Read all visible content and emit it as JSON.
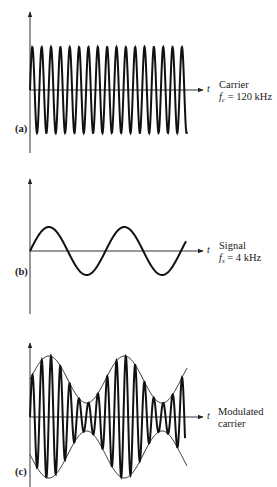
{
  "figure": {
    "panels": [
      {
        "id": "a",
        "label": "(a)",
        "axis_label": "t",
        "caption_line1": "Carrier",
        "caption_var": "f",
        "caption_sub": "c",
        "caption_rest": " = 120 kHz",
        "waveform": "carrier",
        "frequency_khz": 120,
        "axis_x": 30,
        "axis_y": 90,
        "axis_top": 12,
        "axis_bottom": 153,
        "axis_right": 203,
        "wave_start": 30,
        "wave_end": 187,
        "amplitude": 43,
        "period_px": 9.35
      },
      {
        "id": "b",
        "label": "(b)",
        "axis_label": "t",
        "caption_line1": "Signal",
        "caption_var": "f",
        "caption_sub": "s",
        "caption_rest": " = 4 kHz",
        "waveform": "signal",
        "frequency_khz": 4,
        "axis_x": 30,
        "axis_y": 251,
        "axis_top": 179,
        "axis_bottom": 314,
        "axis_right": 203,
        "wave_start": 30,
        "wave_end": 186,
        "amplitude": 24,
        "period_px": 75.5
      },
      {
        "id": "c",
        "label": "(c)",
        "axis_label": "t",
        "caption_line1": "Modulated",
        "caption_line2": "carrier",
        "waveform": "modulated",
        "axis_x": 30,
        "axis_y": 417,
        "axis_top": 343,
        "axis_bottom": 487,
        "axis_right": 203,
        "wave_start": 30,
        "wave_end": 185,
        "envelope_end": 187,
        "envelope_mean": 37.5,
        "envelope_swing": 23.5,
        "carrier_period_px": 9.35,
        "signal_period_px": 75.5
      }
    ],
    "colors": {
      "line": "#111111",
      "axis": "#333333",
      "background": "#ffffff"
    }
  }
}
